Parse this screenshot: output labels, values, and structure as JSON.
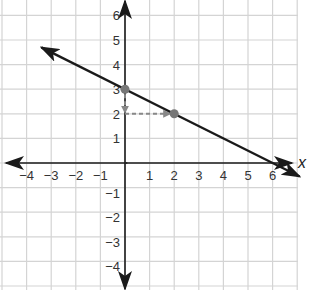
{
  "chart_data": {
    "type": "line",
    "title": "",
    "xlabel": "x",
    "ylabel": "",
    "xlim": [
      -5,
      7
    ],
    "ylim": [
      -5,
      6
    ],
    "grid": true,
    "x_ticks": [
      -4,
      -3,
      -2,
      -1,
      1,
      2,
      3,
      4,
      5,
      6
    ],
    "y_ticks": [
      -4,
      -3,
      -2,
      -1,
      1,
      2,
      3,
      4,
      5,
      6
    ],
    "x_tick_labels": [
      "−4",
      "−3",
      "−2",
      "−1",
      "1",
      "2",
      "3",
      "4",
      "5",
      "6"
    ],
    "y_tick_labels": [
      "−4",
      "−3",
      "−2",
      "−1",
      "1",
      "2",
      "3",
      "4",
      "5",
      "6"
    ],
    "series": [
      {
        "name": "line",
        "equation": "y = -1/2 x + 3",
        "slope": -0.5,
        "intercept": 3,
        "x": [
          -3.4,
          7.1
        ],
        "y": [
          4.7,
          -0.55
        ],
        "arrows": "both",
        "color": "#1a1a1a"
      }
    ],
    "points": [
      {
        "x": 0,
        "y": 3,
        "color": "#777777"
      },
      {
        "x": 2,
        "y": 2,
        "color": "#777777"
      }
    ],
    "annotations": [
      {
        "type": "dashed-arrow",
        "from": [
          0,
          3
        ],
        "to": [
          0,
          2
        ],
        "label": "rise -1",
        "color": "#888888"
      },
      {
        "type": "dashed-arrow",
        "from": [
          0,
          2
        ],
        "to": [
          2,
          2
        ],
        "label": "run 2",
        "color": "#888888"
      }
    ]
  },
  "style": {
    "grid_color": "#d4d4d4",
    "axis_color": "#1a1a1a",
    "line_color": "#1a1a1a",
    "point_color": "#777777",
    "dash_color": "#888888"
  }
}
